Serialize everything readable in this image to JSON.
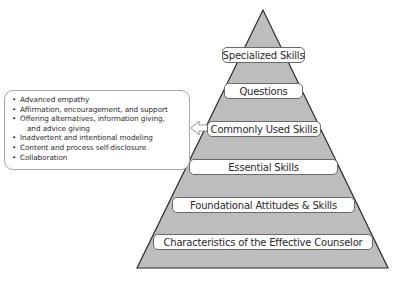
{
  "diagram": {
    "type": "pyramid",
    "colors": {
      "pyramid_fill": "#bdbdbd",
      "pyramid_stroke": "#2b2b2b",
      "label_bg": "#ffffff"
    },
    "levels": [
      {
        "label": "Specialized Skills"
      },
      {
        "label": "Questions"
      },
      {
        "label": "Commonly Used Skills"
      },
      {
        "label": "Essential Skills"
      },
      {
        "label": "Foundational Attitudes & Skills"
      },
      {
        "label": "Characteristics of the Effective Counselor"
      }
    ],
    "callout": {
      "points_to": "Commonly Used Skills",
      "items": [
        "Advanced empathy",
        "Affirmation, encouragement, and support",
        "Offering alternatives, information giving,",
        "and advice giving",
        "Inadvertent and intentional modeling",
        "Content and process self-disclosure",
        "Collaboration"
      ]
    }
  }
}
